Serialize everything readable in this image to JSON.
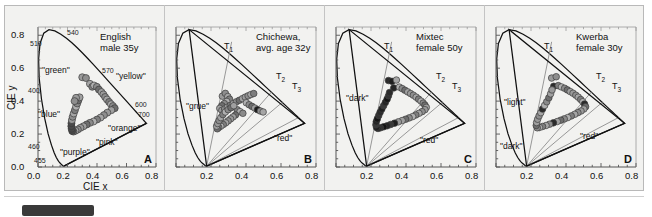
{
  "figure": {
    "background_color": "#f2f2f0",
    "axis_label_x": "CIE x",
    "axis_label_y": "CIE y",
    "x_ticks": [
      "0.0",
      "0.2",
      "0.4",
      "0.6",
      "0.8"
    ],
    "y_ticks": [
      "0.0",
      "0.2",
      "0.4",
      "0.6",
      "0.8"
    ],
    "xlim": [
      0.0,
      0.8
    ],
    "ylim": [
      0.0,
      0.85
    ]
  },
  "chart_data": {
    "type": "scatter",
    "xlabel": "CIE x",
    "ylabel": "CIE y",
    "xlim": [
      0.0,
      0.8
    ],
    "ylim": [
      0.0,
      0.85
    ],
    "grid": false,
    "legend": "none",
    "panels": [
      {
        "letter": "A",
        "title_lines": [
          "English",
          "male 35y"
        ],
        "wavelength_ticks": [
          "510",
          "540",
          "570",
          "600",
          "700",
          "400",
          "460",
          "455"
        ],
        "color_terms": [
          "\"green\"",
          "\"yellow\"",
          "\"blue\"",
          "\"orange\"",
          "\"purple\"",
          "\"pink\""
        ],
        "category_lines": [],
        "points": [
          [
            0.3,
            0.545
          ],
          [
            0.325,
            0.54
          ],
          [
            0.352,
            0.505
          ],
          [
            0.368,
            0.487
          ],
          [
            0.38,
            0.495
          ],
          [
            0.399,
            0.487
          ],
          [
            0.413,
            0.47
          ],
          [
            0.43,
            0.455
          ],
          [
            0.443,
            0.441
          ],
          [
            0.455,
            0.425
          ],
          [
            0.468,
            0.41
          ],
          [
            0.482,
            0.395
          ],
          [
            0.495,
            0.381
          ],
          [
            0.508,
            0.37
          ],
          [
            0.52,
            0.357
          ],
          [
            0.497,
            0.345
          ],
          [
            0.47,
            0.33
          ],
          [
            0.447,
            0.315
          ],
          [
            0.424,
            0.3
          ],
          [
            0.4,
            0.288
          ],
          [
            0.376,
            0.276
          ],
          [
            0.352,
            0.268
          ],
          [
            0.33,
            0.258
          ],
          [
            0.308,
            0.247
          ],
          [
            0.288,
            0.238
          ],
          [
            0.27,
            0.228
          ],
          [
            0.254,
            0.22
          ],
          [
            0.24,
            0.215
          ],
          [
            0.232,
            0.219
          ],
          [
            0.228,
            0.232
          ],
          [
            0.226,
            0.248
          ],
          [
            0.227,
            0.266
          ],
          [
            0.23,
            0.285
          ],
          [
            0.235,
            0.305
          ],
          [
            0.242,
            0.325
          ],
          [
            0.25,
            0.345
          ],
          [
            0.258,
            0.366
          ],
          [
            0.266,
            0.386
          ],
          [
            0.274,
            0.405
          ],
          [
            0.282,
            0.423
          ],
          [
            0.258,
            0.42
          ],
          [
            0.248,
            0.4
          ]
        ]
      },
      {
        "letter": "B",
        "title_lines": [
          "Chichewa,",
          "avg. age 32y"
        ],
        "wavelength_ticks": [],
        "color_terms": [
          "\"grue\"",
          "\"red\""
        ],
        "category_lines": [
          "T1",
          "T2",
          "T3"
        ],
        "points": [
          [
            0.265,
            0.43
          ],
          [
            0.282,
            0.447
          ],
          [
            0.296,
            0.428
          ],
          [
            0.306,
            0.412
          ],
          [
            0.29,
            0.398
          ],
          [
            0.276,
            0.385
          ],
          [
            0.262,
            0.372
          ],
          [
            0.25,
            0.356
          ],
          [
            0.262,
            0.344
          ],
          [
            0.278,
            0.352
          ],
          [
            0.294,
            0.363
          ],
          [
            0.31,
            0.374
          ],
          [
            0.328,
            0.385
          ],
          [
            0.345,
            0.396
          ],
          [
            0.362,
            0.405
          ],
          [
            0.38,
            0.415
          ],
          [
            0.396,
            0.424
          ],
          [
            0.412,
            0.432
          ],
          [
            0.428,
            0.44
          ],
          [
            0.444,
            0.446
          ],
          [
            0.402,
            0.39
          ],
          [
            0.418,
            0.378
          ],
          [
            0.434,
            0.368
          ],
          [
            0.45,
            0.358
          ],
          [
            0.466,
            0.348
          ],
          [
            0.482,
            0.34
          ],
          [
            0.498,
            0.334
          ],
          [
            0.35,
            0.348
          ],
          [
            0.366,
            0.336
          ],
          [
            0.382,
            0.326
          ],
          [
            0.34,
            0.316
          ],
          [
            0.326,
            0.304
          ],
          [
            0.312,
            0.292
          ],
          [
            0.298,
            0.28
          ],
          [
            0.284,
            0.268
          ],
          [
            0.27,
            0.258
          ],
          [
            0.256,
            0.248
          ],
          [
            0.244,
            0.24
          ],
          [
            0.236,
            0.232
          ],
          [
            0.232,
            0.248
          ],
          [
            0.238,
            0.264
          ],
          [
            0.246,
            0.282
          ],
          [
            0.256,
            0.3
          ],
          [
            0.268,
            0.318
          ],
          [
            0.282,
            0.334
          ],
          [
            0.298,
            0.348
          ],
          [
            0.314,
            0.36
          ],
          [
            0.33,
            0.372
          ]
        ]
      },
      {
        "letter": "C",
        "title_lines": [
          "Mixtec",
          "female 50y"
        ],
        "wavelength_ticks": [],
        "color_terms": [
          "\"dark\"",
          "\"red\""
        ],
        "category_lines": [
          "T1",
          "T2",
          "T3"
        ],
        "points": [
          [
            0.3,
            0.525
          ],
          [
            0.32,
            0.52
          ],
          [
            0.345,
            0.528
          ],
          [
            0.33,
            0.48
          ],
          [
            0.362,
            0.485
          ],
          [
            0.378,
            0.476
          ],
          [
            0.394,
            0.466
          ],
          [
            0.41,
            0.456
          ],
          [
            0.426,
            0.446
          ],
          [
            0.442,
            0.436
          ],
          [
            0.458,
            0.424
          ],
          [
            0.472,
            0.412
          ],
          [
            0.486,
            0.4
          ],
          [
            0.498,
            0.388
          ],
          [
            0.508,
            0.376
          ],
          [
            0.516,
            0.362
          ],
          [
            0.508,
            0.348
          ],
          [
            0.492,
            0.336
          ],
          [
            0.474,
            0.326
          ],
          [
            0.456,
            0.316
          ],
          [
            0.438,
            0.306
          ],
          [
            0.418,
            0.298
          ],
          [
            0.398,
            0.29
          ],
          [
            0.378,
            0.282
          ],
          [
            0.356,
            0.274
          ],
          [
            0.334,
            0.266
          ],
          [
            0.312,
            0.258
          ],
          [
            0.292,
            0.25
          ],
          [
            0.272,
            0.244
          ],
          [
            0.254,
            0.238
          ],
          [
            0.24,
            0.234
          ],
          [
            0.232,
            0.24
          ],
          [
            0.228,
            0.256
          ],
          [
            0.23,
            0.274
          ],
          [
            0.236,
            0.292
          ],
          [
            0.244,
            0.312
          ],
          [
            0.252,
            0.332
          ],
          [
            0.262,
            0.352
          ],
          [
            0.272,
            0.372
          ],
          [
            0.282,
            0.392
          ],
          [
            0.292,
            0.412
          ],
          [
            0.3,
            0.432
          ],
          [
            0.306,
            0.452
          ]
        ]
      },
      {
        "letter": "D",
        "title_lines": [
          "Kwerba",
          "female 30y"
        ],
        "wavelength_ticks": [],
        "color_terms": [
          "\"light\"",
          "\"dark\"",
          "\"red\""
        ],
        "category_lines": [
          "T1",
          "T2",
          "T3"
        ],
        "points": [
          [
            0.318,
            0.54
          ],
          [
            0.344,
            0.548
          ],
          [
            0.33,
            0.49
          ],
          [
            0.356,
            0.494
          ],
          [
            0.374,
            0.486
          ],
          [
            0.392,
            0.478
          ],
          [
            0.408,
            0.468
          ],
          [
            0.424,
            0.458
          ],
          [
            0.44,
            0.448
          ],
          [
            0.456,
            0.436
          ],
          [
            0.47,
            0.424
          ],
          [
            0.484,
            0.41
          ],
          [
            0.496,
            0.396
          ],
          [
            0.506,
            0.382
          ],
          [
            0.512,
            0.366
          ],
          [
            0.502,
            0.352
          ],
          [
            0.486,
            0.34
          ],
          [
            0.468,
            0.33
          ],
          [
            0.45,
            0.32
          ],
          [
            0.43,
            0.31
          ],
          [
            0.41,
            0.3
          ],
          [
            0.39,
            0.292
          ],
          [
            0.37,
            0.284
          ],
          [
            0.35,
            0.276
          ],
          [
            0.328,
            0.268
          ],
          [
            0.306,
            0.26
          ],
          [
            0.286,
            0.252
          ],
          [
            0.266,
            0.246
          ],
          [
            0.248,
            0.24
          ],
          [
            0.236,
            0.238
          ],
          [
            0.23,
            0.252
          ],
          [
            0.232,
            0.27
          ],
          [
            0.238,
            0.29
          ],
          [
            0.246,
            0.31
          ],
          [
            0.256,
            0.33
          ],
          [
            0.266,
            0.352
          ],
          [
            0.278,
            0.374
          ],
          [
            0.29,
            0.396
          ],
          [
            0.302,
            0.42
          ],
          [
            0.312,
            0.444
          ],
          [
            0.32,
            0.468
          ]
        ]
      }
    ]
  }
}
